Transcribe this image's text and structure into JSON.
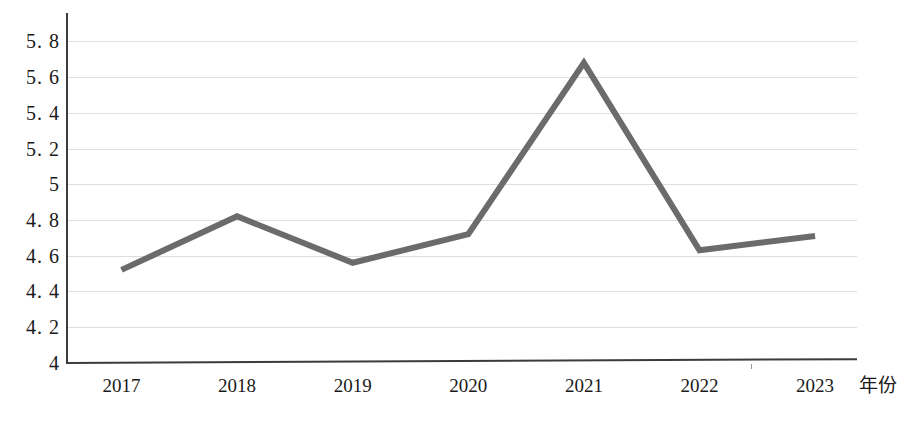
{
  "chart_data": {
    "type": "line",
    "title": "",
    "xlabel": "年份",
    "ylabel": "",
    "categories": [
      "2017",
      "2018",
      "2019",
      "2020",
      "2021",
      "2022",
      "2023"
    ],
    "values": [
      4.52,
      4.82,
      4.56,
      4.72,
      5.68,
      4.63,
      4.71
    ],
    "series": [
      {
        "name": "",
        "values": [
          4.52,
          4.82,
          4.56,
          4.72,
          5.68,
          4.63,
          4.71
        ],
        "color": "#6b6b6b"
      }
    ],
    "ylim": [
      4,
      5.9
    ],
    "y_ticks": [
      4,
      4.2,
      4.4,
      4.6,
      4.8,
      5,
      5.2,
      5.4,
      5.6,
      5.8
    ],
    "y_tick_labels": [
      "4",
      "4. 2",
      "4. 4",
      "4. 6",
      "4. 8",
      "5",
      "5. 2",
      "5. 4",
      "5. 6",
      "5. 8"
    ],
    "grid": true,
    "grid_color": "#dedede",
    "legend": "none",
    "legend_position": "none",
    "axis_color": "#3b3b3b",
    "background": "#ffffff",
    "annotations": []
  }
}
